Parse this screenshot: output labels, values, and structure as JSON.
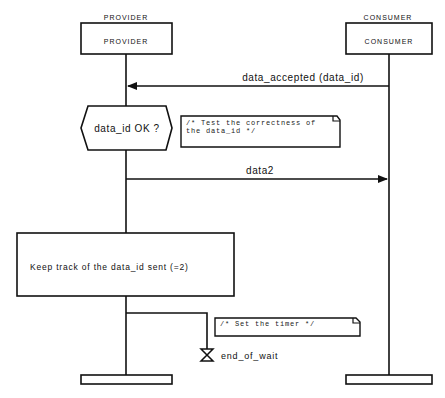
{
  "diagram": {
    "type": "MSC sequence diagram",
    "instances": [
      {
        "id": "provider",
        "header_label": "PROVIDER",
        "box_label": "PROVIDER"
      },
      {
        "id": "consumer",
        "header_label": "CONSUMER",
        "box_label": "CONSUMER"
      }
    ],
    "messages": [
      {
        "id": "msg1",
        "label": "data_accepted (data_id)",
        "from": "consumer",
        "to": "provider"
      },
      {
        "id": "msg2",
        "label": "data2",
        "from": "provider",
        "to": "consumer"
      }
    ],
    "decision": {
      "label": "data_id OK ?"
    },
    "comments": [
      {
        "line1": "/* Test the correctness of",
        "line2": "the data_id */"
      },
      {
        "line1": "/* Set the timer */"
      }
    ],
    "action": {
      "label": "Keep track of the data_id sent (=2)"
    },
    "timer": {
      "label": "end_of_wait"
    }
  }
}
